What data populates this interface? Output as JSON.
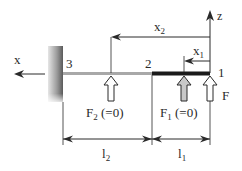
{
  "labels": {
    "x_axis": "x",
    "z_axis": "z",
    "node_3": "3",
    "node_2": "2",
    "node_1": "1",
    "x2": "x",
    "x2_sub": "2",
    "x1": "x",
    "x1_sub": "1",
    "force_F": "F",
    "force_F2": "F",
    "force_F2_sub": "2",
    "force_F2_note": " (=0)",
    "force_F1": "F",
    "force_F1_sub": "1",
    "force_F1_note": " (=0)",
    "l2": "l",
    "l2_sub": "2",
    "l1": "l",
    "l1_sub": "1"
  },
  "colors": {
    "line": "#2a2a2a",
    "beam_segment_1": "#1a1a1a",
    "beam_segment_2": "#a8a8a8",
    "wall_dark": "#6a6a6a",
    "wall_light": "#e0e0e0",
    "arrow_fill_gray": "#c8c8c8",
    "arrow_fill_white": "#ffffff"
  }
}
